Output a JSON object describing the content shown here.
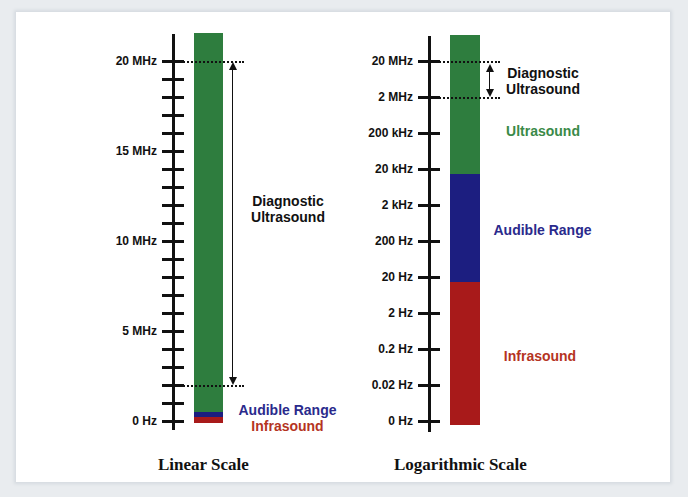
{
  "colors": {
    "ultrasound": "#2e7d3e",
    "audible": "#1c1e80",
    "infrasound": "#a81a1a",
    "diagnostic_label": "#111111",
    "ultrasound_label": "#3a8a48",
    "audible_label": "#2a2a8c",
    "infrasound_label": "#b5341f"
  },
  "linear": {
    "caption": "Linear Scale",
    "tick_labels": [
      "20 MHz",
      "15 MHz",
      "10 MHz",
      "5 MHz",
      "0 Hz"
    ],
    "labels": {
      "diagnostic_line1": "Diagnostic",
      "diagnostic_line2": "Ultrasound",
      "audible": "Audible Range",
      "infrasound": "Infrasound"
    }
  },
  "log": {
    "caption": "Logarithmic Scale",
    "tick_labels": [
      "20 MHz",
      "2 MHz",
      "200 kHz",
      "20 kHz",
      "2 kHz",
      "200 Hz",
      "20 Hz",
      "2 Hz",
      "0.2 Hz",
      "0.02 Hz",
      "0 Hz"
    ],
    "labels": {
      "diagnostic_line1": "Diagnostic",
      "diagnostic_line2": "Ultrasound",
      "ultrasound": "Ultrasound",
      "audible": "Audible Range",
      "infrasound": "Infrasound"
    }
  },
  "chart_data": [
    {
      "type": "bar",
      "title": "Linear Scale",
      "axis": "frequency (linear)",
      "ticks": [
        "0 Hz",
        "5 MHz",
        "10 MHz",
        "15 MHz",
        "20 MHz"
      ],
      "minor_tick_step": "1 MHz",
      "segments": [
        {
          "name": "Infrasound",
          "from": "0 Hz",
          "to": "20 Hz"
        },
        {
          "name": "Audible Range",
          "from": "20 Hz",
          "to": "20 kHz"
        },
        {
          "name": "Ultrasound",
          "from": "20 kHz",
          "to": "> 20 MHz"
        }
      ],
      "annotations": [
        {
          "name": "Diagnostic Ultrasound",
          "from": "2 MHz",
          "to": "20 MHz"
        }
      ]
    },
    {
      "type": "bar",
      "title": "Logarithmic Scale",
      "axis": "frequency (log)",
      "ticks": [
        "0 Hz",
        "0.02 Hz",
        "0.2 Hz",
        "2 Hz",
        "20 Hz",
        "200 Hz",
        "2 kHz",
        "20 kHz",
        "200 kHz",
        "2 MHz",
        "20 MHz"
      ],
      "segments": [
        {
          "name": "Infrasound",
          "from": "0 Hz",
          "to": "20 Hz"
        },
        {
          "name": "Audible Range",
          "from": "20 Hz",
          "to": "20 kHz"
        },
        {
          "name": "Ultrasound",
          "from": "20 kHz",
          "to": "> 20 MHz"
        }
      ],
      "annotations": [
        {
          "name": "Diagnostic Ultrasound",
          "from": "2 MHz",
          "to": "20 MHz"
        }
      ]
    }
  ]
}
